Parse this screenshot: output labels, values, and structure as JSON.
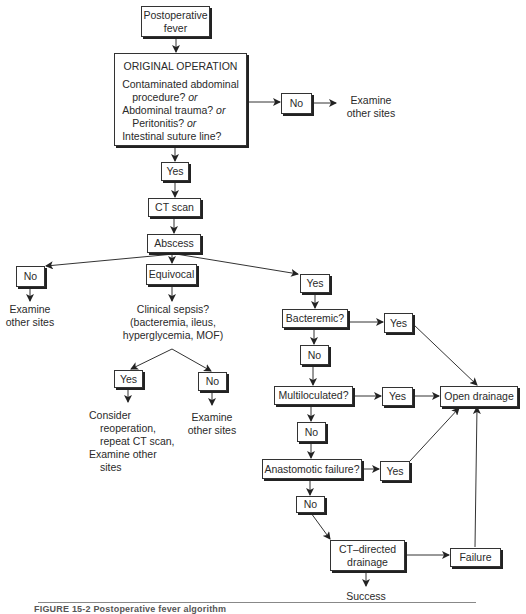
{
  "diagram": {
    "type": "flowchart",
    "caption": "FIGURE 15-2 Postoperative fever algorithm",
    "nodes": {
      "start": "Postoperative fever",
      "original_operation": {
        "title": "ORIGINAL OPERATION",
        "q1": "Contaminated abdominal",
        "q1b": "procedure?",
        "q2": "Abdominal trauma?",
        "q3": "Peritonitis?",
        "q4": "Intestinal suture line?",
        "or": "or"
      },
      "op_no": "No",
      "op_no_result_1": "Examine",
      "op_no_result_2": "other sites",
      "op_yes": "Yes",
      "ct_scan": "CT scan",
      "abscess": "Abscess",
      "abscess_no": "No",
      "abscess_no_result_1": "Examine",
      "abscess_no_result_2": "other sites",
      "equivocal": "Equivocal",
      "sepsis_1": "Clinical sepsis?",
      "sepsis_2": "(bacteremia, ileus,",
      "sepsis_3": "hyperglycemia, MOF)",
      "sepsis_yes": "Yes",
      "sepsis_no": "No",
      "sepsis_yes_result_1": "Consider",
      "sepsis_yes_result_2": "reoperation,",
      "sepsis_yes_result_3": "repeat CT scan,",
      "sepsis_yes_result_4": "Examine other",
      "sepsis_yes_result_5": "sites",
      "sepsis_no_result_1": "Examine",
      "sepsis_no_result_2": "other sites",
      "abscess_yes": "Yes",
      "bacteremic": "Bacteremic?",
      "bacteremic_yes": "Yes",
      "bacteremic_no": "No",
      "multiloculated": "Multiloculated?",
      "multiloculated_yes": "Yes",
      "multiloculated_no": "No",
      "open_drainage": "Open drainage",
      "anastomotic": "Anastomotic failure?",
      "anastomotic_yes": "Yes",
      "anastomotic_no": "No",
      "ct_directed_1": "CT–directed",
      "ct_directed_2": "drainage",
      "failure": "Failure",
      "success": "Success"
    },
    "colors": {
      "line": "#333333",
      "text": "#2a2a2a",
      "background": "#ffffff"
    }
  }
}
